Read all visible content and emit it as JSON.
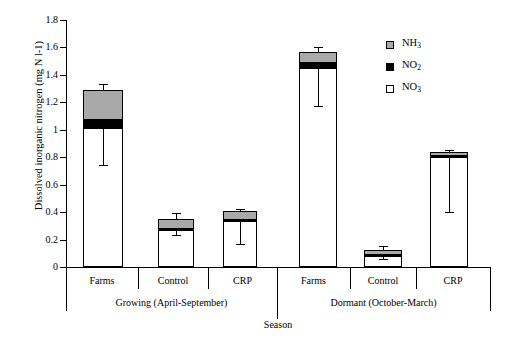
{
  "chart_data": {
    "type": "bar",
    "title": "",
    "stacked": true,
    "xlabel": "Season",
    "ylabel": "Dissolved inorganic nitrogen (mg N l-1)",
    "ylim": [
      0,
      1.8
    ],
    "yticks": [
      "0",
      "0.2",
      "0.4",
      "0.6",
      "0.8",
      "1",
      "1.2",
      "1.4",
      "1.6",
      "1.8"
    ],
    "ytick_values": [
      0,
      0.2,
      0.4,
      0.6,
      0.8,
      1.0,
      1.2,
      1.4,
      1.6,
      1.8
    ],
    "grid": false,
    "legend_position": "upper-right",
    "legend": [
      {
        "name": "NH3",
        "label_main": "NH",
        "label_sub": "3",
        "color": "#a9a9a9"
      },
      {
        "name": "NO2",
        "label_main": "NO",
        "label_sub": "2",
        "color": "#000000"
      },
      {
        "name": "NO3",
        "label_main": "NO",
        "label_sub": "3",
        "color": "#ffffff"
      }
    ],
    "groups": [
      {
        "label": "Growing (April-September)",
        "categories": [
          "Farms",
          "Control",
          "CRP"
        ]
      },
      {
        "label": "Dormant (October-March)",
        "categories": [
          "Farms",
          "Control",
          "CRP"
        ]
      }
    ],
    "categories": [
      "Farms",
      "Control",
      "CRP",
      "Farms",
      "Control",
      "CRP"
    ],
    "series": [
      {
        "name": "NO3",
        "values": [
          1.01,
          0.27,
          0.335,
          1.45,
          0.085,
          0.8
        ]
      },
      {
        "name": "NO2",
        "values": [
          0.06,
          0.005,
          0.005,
          0.04,
          0.005,
          0.01
        ]
      },
      {
        "name": "NH3",
        "values": [
          0.22,
          0.075,
          0.07,
          0.075,
          0.035,
          0.025
        ]
      }
    ],
    "totals": [
      1.29,
      0.35,
      0.41,
      1.565,
      0.125,
      0.835
    ],
    "error_bars_total": [
      {
        "value": 1.29,
        "upper": 1.335,
        "lower": 1.29
      },
      {
        "value": 0.35,
        "upper": 0.395,
        "lower": 0.35
      },
      {
        "value": 0.41,
        "upper": 0.425,
        "lower": 0.41
      },
      {
        "value": 1.565,
        "upper": 1.6,
        "lower": 1.565
      },
      {
        "value": 0.125,
        "upper": 0.15,
        "lower": 0.125
      },
      {
        "value": 0.835,
        "upper": 0.855,
        "lower": 0.835
      }
    ],
    "error_bars_no3": [
      {
        "value": 1.01,
        "upper": 1.01,
        "lower": 0.745
      },
      {
        "value": 0.27,
        "upper": 0.27,
        "lower": 0.235
      },
      {
        "value": 0.335,
        "upper": 0.335,
        "lower": 0.165
      },
      {
        "value": 1.45,
        "upper": 1.45,
        "lower": 1.175
      },
      {
        "value": 0.085,
        "upper": 0.085,
        "lower": 0.06
      },
      {
        "value": 0.8,
        "upper": 0.8,
        "lower": 0.4
      }
    ]
  }
}
